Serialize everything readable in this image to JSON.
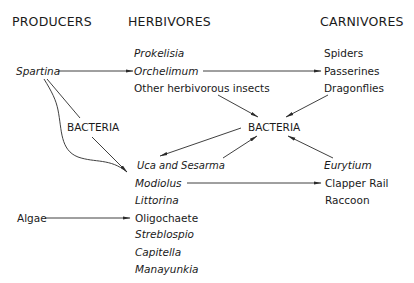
{
  "headers": {
    "producers": "PRODUCERS",
    "herbivores": "HERBIVORES",
    "carnivores": "CARNIVORES"
  },
  "producers": {
    "spartina": "Spartina",
    "algae": "Algae"
  },
  "herbivores": {
    "prokelisia": "Prokelisia",
    "orchelimum": "Orchelimum",
    "other_insects": "Other herbivorous insects",
    "uca_sesarma": "Uca and Sesarma",
    "modiolus": "Modiolus",
    "littorina": "Littorina",
    "oligochaete": "Oligochaete",
    "streblospio": "Streblospio",
    "capitella": "Capitella",
    "manayunkia": "Manayunkia"
  },
  "carnivores": {
    "spiders": "Spiders",
    "passerines": "Passerines",
    "dragonflies": "Dragonflies",
    "eurytium": "Eurytium",
    "clapper_rail": "Clapper Rail",
    "raccoon": "Raccoon"
  },
  "decomposers": {
    "bacteria_center": "BACTERIA",
    "bacteria_left": "BACTERIA"
  },
  "links": [
    {
      "from": "Spartina",
      "to": "Orchelimum"
    },
    {
      "from": "Orchelimum",
      "to": "Passerines"
    },
    {
      "from": "Spartina",
      "to": "Uca and Sesarma / Modiolus",
      "via": "BACTERIA"
    },
    {
      "from": "Other herbivorous insects",
      "to": "BACTERIA"
    },
    {
      "from": "Dragonflies",
      "to": "BACTERIA"
    },
    {
      "from": "BACTERIA",
      "to": "Uca and Sesarma"
    },
    {
      "from": "Uca and Sesarma",
      "to": "BACTERIA"
    },
    {
      "from": "Eurytium",
      "to": "BACTERIA"
    },
    {
      "from": "Modiolus",
      "to": "Clapper Rail"
    },
    {
      "from": "Algae",
      "to": "Oligochaete"
    }
  ]
}
